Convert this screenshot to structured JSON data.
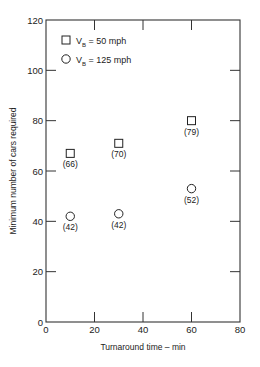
{
  "chart_data": {
    "type": "scatter",
    "title": "",
    "xlabel": "Turnaround time – min",
    "ylabel": "Minimum number of cars required",
    "xlim": [
      0,
      80
    ],
    "ylim": [
      0,
      120
    ],
    "xticks": [
      "0",
      "20",
      "40",
      "60",
      "80"
    ],
    "yticks": [
      "0",
      "20",
      "40",
      "60",
      "80",
      "100",
      "120"
    ],
    "grid": false,
    "legend_position": "upper-left",
    "series": [
      {
        "name": "V_B = 50 mph",
        "marker": "square",
        "points": [
          {
            "x": 10,
            "y": 67,
            "label": "(66)"
          },
          {
            "x": 30,
            "y": 71,
            "label": "(70)"
          },
          {
            "x": 60,
            "y": 80,
            "label": "(79)"
          }
        ]
      },
      {
        "name": "V_B = 125 mph",
        "marker": "circle",
        "points": [
          {
            "x": 10,
            "y": 42,
            "label": "(42)"
          },
          {
            "x": 30,
            "y": 43,
            "label": "(42)"
          },
          {
            "x": 60,
            "y": 53,
            "label": "(52)"
          }
        ]
      }
    ]
  },
  "legend": {
    "items": [
      {
        "prefix": "V",
        "sub": "B",
        "suffix": " = 50 mph"
      },
      {
        "prefix": "V",
        "sub": "B",
        "suffix": " = 125 mph"
      }
    ]
  }
}
